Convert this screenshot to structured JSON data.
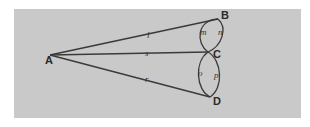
{
  "diagram": {
    "background_color": "#c9c9c9",
    "line_color": "#3a3a3a",
    "points": [
      {
        "id": "A",
        "label": "A",
        "x": 50,
        "y": 55
      },
      {
        "id": "B",
        "label": "B",
        "x": 218,
        "y": 19
      },
      {
        "id": "C",
        "label": "C",
        "x": 208,
        "y": 52
      },
      {
        "id": "D",
        "label": "D",
        "x": 210,
        "y": 97
      }
    ],
    "segments": [
      {
        "from": "A",
        "to": "B",
        "label": "l"
      },
      {
        "from": "A",
        "to": "C",
        "label": "s"
      },
      {
        "from": "A",
        "to": "D",
        "label": "r"
      }
    ],
    "arcs": [
      {
        "from": "B",
        "to": "C",
        "side": "left",
        "label": "m"
      },
      {
        "from": "B",
        "to": "C",
        "side": "right",
        "label": "n"
      },
      {
        "from": "C",
        "to": "D",
        "side": "left",
        "label": "o"
      },
      {
        "from": "C",
        "to": "D",
        "side": "right",
        "label": "p"
      }
    ]
  }
}
